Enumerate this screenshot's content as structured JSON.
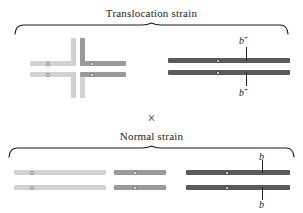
{
  "figure": {
    "width": 303,
    "height": 213,
    "background": "#ffffff"
  },
  "cross_symbol": "×",
  "panels": [
    {
      "id": "translocation",
      "title": "Translocation strain",
      "brace": {
        "x": 14,
        "y": 22,
        "width": 275,
        "height": 10
      }
    },
    {
      "id": "normal",
      "title": "Normal strain",
      "brace": {
        "x": 8,
        "y": 145,
        "width": 287,
        "height": 10
      }
    }
  ],
  "karyotypes": {
    "translocation_cross": {
      "description": "reciprocal translocation cross configuration",
      "arms": {
        "left_horizontal_color": "#d2d2d2",
        "right_horizontal_color": "#9a9a9a",
        "vertical_upper_color": "#9a9a9a",
        "vertical_lower_color": "#d2d2d2"
      }
    },
    "translocation_pair": {
      "color": "#5a5a5a",
      "markers": [
        "b⁺",
        "b⁺"
      ]
    },
    "normal_pairs": [
      {
        "color": "#d2d2d2",
        "markers": []
      },
      {
        "color": "#9a9a9a",
        "markers": []
      },
      {
        "color": "#5a5a5a",
        "markers": [
          "b",
          "b"
        ]
      }
    ]
  },
  "alleles": {
    "plus_top": "b",
    "plus_top_sup": "+",
    "plus_bottom": "b",
    "plus_bottom_sup": "+",
    "normal_top": "b",
    "normal_bottom": "b"
  },
  "colors": {
    "light_gray": "#d2d2d2",
    "medium_gray": "#9a9a9a",
    "dark_gray": "#5a5a5a",
    "ink": "#1c1c1c",
    "background": "#ffffff"
  }
}
